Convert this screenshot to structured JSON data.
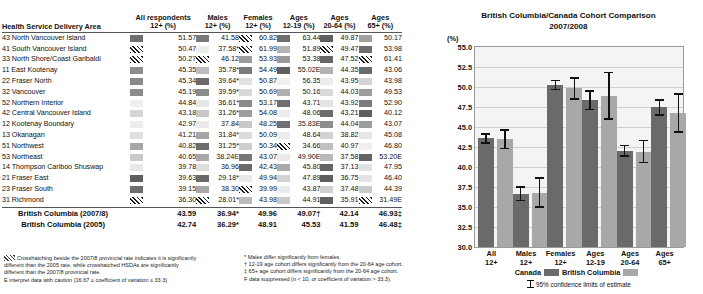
{
  "table": {
    "row_header_label": "Health Service Delivery Area",
    "columns": [
      {
        "title": "All respondents",
        "sub": "12+ (%)"
      },
      {
        "title": "Males",
        "sub": "12+ (%)"
      },
      {
        "title": "Females",
        "sub": "12+ (%)"
      },
      {
        "title": "Ages",
        "sub": "12-19 (%)"
      },
      {
        "title": "Ages",
        "sub": "20-64 (%)"
      },
      {
        "title": "Ages",
        "sub": "65+ (%)"
      }
    ],
    "rows": [
      {
        "name": "43 North Vancouver Island",
        "cells": [
          {
            "v": "51.57",
            "s": "#6f6f6f"
          },
          {
            "v": "41.58",
            "s": "#7a7a7a"
          },
          {
            "v": "60.82",
            "s": "hatch"
          },
          {
            "v": "63.44",
            "s": "#6e6e6e"
          },
          {
            "v": "49.87",
            "s": "#5f5f5f"
          },
          {
            "v": "50.17",
            "s": "#a0a0a0"
          }
        ]
      },
      {
        "name": "41 South Vancouver Island",
        "cells": [
          {
            "v": "50.47",
            "s": "hatch"
          },
          {
            "v": "37.58*",
            "s": "#ededed"
          },
          {
            "v": "61.99",
            "s": "hatch"
          },
          {
            "v": "51.89",
            "s": "#b4b4b4"
          },
          {
            "v": "49.47",
            "s": "hatch"
          },
          {
            "v": "53.98",
            "s": "#6e6e6e"
          }
        ]
      },
      {
        "name": "33 North Shore/Coast Garibaldi",
        "cells": [
          {
            "v": "50.27",
            "s": "hatch"
          },
          {
            "v": "46.12",
            "s": "hatch"
          },
          {
            "v": "53.93",
            "s": "#9c9c9c"
          },
          {
            "v": "53.38",
            "s": "#9a9a9a"
          },
          {
            "v": "47.52",
            "s": "#666666"
          },
          {
            "v": "61.41",
            "s": "hatch"
          }
        ]
      },
      {
        "name": "11 East Kootenay",
        "cells": [
          {
            "v": "45.35",
            "s": "#8d8d8d"
          },
          {
            "v": "35.78*",
            "s": "#bcbcbc"
          },
          {
            "v": "54.49",
            "s": "#7a7a7a"
          },
          {
            "v": "55.02E",
            "s": "#5f5f5f"
          },
          {
            "v": "44.35",
            "s": "#b2b2b2"
          },
          {
            "v": "43.06",
            "s": "#6a6a6a"
          }
        ]
      },
      {
        "name": "22 Fraser North",
        "cells": [
          {
            "v": "45.34",
            "s": "#8a8a8a"
          },
          {
            "v": "39.64*",
            "s": "#6b6b6b"
          },
          {
            "v": "50.87",
            "s": "#e2e2e2"
          },
          {
            "v": "56.35",
            "s": "#efefef"
          },
          {
            "v": "43.95",
            "s": "#ececec"
          },
          {
            "v": "43.98",
            "s": "#d4d4d4"
          }
        ]
      },
      {
        "name": "32 Vancouver",
        "cells": [
          {
            "v": "45.19",
            "s": "#8b8b8b"
          },
          {
            "v": "39.59*",
            "s": "#8c8c8c"
          },
          {
            "v": "50.69",
            "s": "#d8d8d8"
          },
          {
            "v": "50.16",
            "s": "#b0b0b0"
          },
          {
            "v": "44.03",
            "s": "#d9d9d9"
          },
          {
            "v": "49.53",
            "s": "#9d9d9d"
          }
        ]
      },
      {
        "name": "52 Northern Interior",
        "cells": [
          {
            "v": "44.84",
            "s": "#efefef"
          },
          {
            "v": "36.61*",
            "s": "#e6e6e6"
          },
          {
            "v": "53.17",
            "s": "#8a8a8a"
          },
          {
            "v": "43.71",
            "s": "#6f6f6f"
          },
          {
            "v": "43.92",
            "s": "#e4e4e4"
          },
          {
            "v": "52.90",
            "s": "#7b7b7b"
          }
        ]
      },
      {
        "name": "42 Central Vancouver Island",
        "cells": [
          {
            "v": "43.18",
            "s": "#d6d6d6"
          },
          {
            "v": "31.26*",
            "s": "#c7c7c7"
          },
          {
            "v": "54.08",
            "s": "#9e9e9e"
          },
          {
            "v": "48.06",
            "s": "#ececec"
          },
          {
            "v": "43.21",
            "s": "#6d6d6d"
          },
          {
            "v": "40.12",
            "s": "#5e5e5e"
          }
        ]
      },
      {
        "name": "12 Kootenay Boundary",
        "cells": [
          {
            "v": "42.97",
            "s": "#ededed"
          },
          {
            "v": "37.84",
            "s": "#e9e9e9"
          },
          {
            "v": "48.25",
            "s": "#c8c8c8"
          },
          {
            "v": "35.83E",
            "s": "#6f6f6f"
          },
          {
            "v": "44.04",
            "s": "#8e8e8e"
          },
          {
            "v": "43.07",
            "s": "#9c9c9c"
          }
        ]
      },
      {
        "name": "13 Okanagan",
        "cells": [
          {
            "v": "41.21",
            "s": "#e0e0e0"
          },
          {
            "v": "31.84*",
            "s": "#a6a6a6"
          },
          {
            "v": "50.09",
            "s": "#dcdcdc"
          },
          {
            "v": "48.64",
            "s": "#ececec"
          },
          {
            "v": "38.82",
            "s": "#d2d2d2"
          },
          {
            "v": "45.08",
            "s": "#e6e6e6"
          }
        ]
      },
      {
        "name": "51 Northwest",
        "cells": [
          {
            "v": "40.82",
            "s": "#a7a7a7"
          },
          {
            "v": "31.25*",
            "s": "#6c6c6c"
          },
          {
            "v": "50.34",
            "s": "#cecece"
          },
          {
            "v": "34.66",
            "s": "hatch"
          },
          {
            "v": "40.97",
            "s": "#c0c0c0"
          },
          {
            "v": "46.80",
            "s": "#efefef"
          }
        ]
      },
      {
        "name": "53 Northeast",
        "cells": [
          {
            "v": "40.65",
            "s": "#c9c9c9"
          },
          {
            "v": "38.24E",
            "s": "#a9a9a9"
          },
          {
            "v": "43.07",
            "s": "#767676"
          },
          {
            "v": "49.90E",
            "s": "#e9e9e9"
          },
          {
            "v": "37.58",
            "s": "#bababa"
          },
          {
            "v": "53.20E",
            "s": "#636363"
          }
        ]
      },
      {
        "name": "14 Thompson Cariboo Shuswap",
        "cells": [
          {
            "v": "39.78",
            "s": "#e7e7e7"
          },
          {
            "v": "36.96",
            "s": "#dedede"
          },
          {
            "v": "42.43",
            "s": "#6a6a6a"
          },
          {
            "v": "45.80",
            "s": "#a9a9a9"
          },
          {
            "v": "37.13",
            "s": "#646464"
          },
          {
            "v": "47.95",
            "s": "#e1e1e1"
          }
        ]
      },
      {
        "name": "21 Fraser East",
        "cells": [
          {
            "v": "39.63",
            "s": "#5f5f5f"
          },
          {
            "v": "29.18*",
            "s": "#6a6a6a"
          },
          {
            "v": "49.94",
            "s": "#e8e8e8"
          },
          {
            "v": "47.89",
            "s": "#d3d3d3"
          },
          {
            "v": "36.75",
            "s": "#5d5d5d"
          },
          {
            "v": "46.40",
            "s": "#e3e3e3"
          }
        ]
      },
      {
        "name": "23 Fraser South",
        "cells": [
          {
            "v": "39.15",
            "s": "#6d6d6d"
          },
          {
            "v": "38.30",
            "s": "#a7a7a7"
          },
          {
            "v": "39.99",
            "s": "hatch"
          },
          {
            "v": "43.87",
            "s": "#ebebeb"
          },
          {
            "v": "37.48",
            "s": "#d0d0d0"
          },
          {
            "v": "44.39",
            "s": "#cacaca"
          }
        ]
      },
      {
        "name": "31 Richmond",
        "cells": [
          {
            "v": "36.30",
            "s": "hatch"
          },
          {
            "v": "28.01*",
            "s": "hatch"
          },
          {
            "v": "43.98",
            "s": "#bcbcbc"
          },
          {
            "v": "44.91",
            "s": "#c9c9c9"
          },
          {
            "v": "35.91",
            "s": "#606060"
          },
          {
            "v": "31.49E",
            "s": "hatch"
          }
        ]
      }
    ],
    "summary": [
      {
        "name": "British Columbia (2007/8)",
        "values": [
          "43.59",
          "36.94*",
          "49.96",
          "49.07†",
          "42.14",
          "46.93‡"
        ]
      },
      {
        "name": "British Columbia (2005)",
        "values": [
          "42.74",
          "36.29*",
          "48.91",
          "45.53",
          "41.59",
          "46.48‡"
        ]
      }
    ]
  },
  "footnotes": {
    "left": [
      "Crosshatching beside the 2007/8 provincial rate indicates it is significantly different than the 2005 rate, while crosshatched HSDAs are significantly different than the 2007/8 provincial rate.",
      "E interpret data with caution (16.67 ≤ coefficient of variation ≤ 33.3)"
    ],
    "right": [
      "* Males differ significantly from females.",
      "† 12-19 age cohort differs significantly from the 20-64 age cohort.",
      "‡ 65+ age cohort differs significantly from the 20-64 age cohort.",
      "F data suppressed (n < 10, or coefficient of variation > 33.3)."
    ]
  },
  "chart_data": {
    "type": "bar",
    "title": "British Columbia/Canada Cohort Comparison",
    "subtitle": "2007/2008",
    "ylabel": "(%)",
    "xlabel": "",
    "ylim": [
      30.0,
      55.0
    ],
    "yticks": [
      "55.0",
      "52.5",
      "50.0",
      "47.5",
      "45.0",
      "42.5",
      "40.0",
      "37.5",
      "35.0",
      "32.5",
      "30.0"
    ],
    "grid": true,
    "legend_position": "bottom",
    "categories": [
      "All\n12+",
      "Males\n12+",
      "Females\n12+",
      "Ages\n12-19",
      "Ages\n20-64",
      "Ages\n65+"
    ],
    "category_lines": [
      [
        "All",
        "12+"
      ],
      [
        "Males",
        "12+"
      ],
      [
        "Females",
        "12+"
      ],
      [
        "Ages",
        "12-19"
      ],
      [
        "Ages",
        "20-64"
      ],
      [
        "Ages",
        "65+"
      ]
    ],
    "series": [
      {
        "name": "Canada",
        "color": "#6a6a6a",
        "values": [
          43.6,
          36.6,
          50.3,
          48.4,
          42.0,
          47.5
        ],
        "ci_low": [
          42.9,
          35.7,
          49.6,
          47.1,
          41.3,
          46.4
        ],
        "ci_high": [
          44.2,
          37.6,
          50.9,
          49.6,
          42.8,
          48.5
        ]
      },
      {
        "name": "British Columbia",
        "color": "#a8a8a8",
        "values": [
          43.5,
          36.8,
          49.9,
          48.9,
          41.9,
          46.7
        ],
        "ci_low": [
          42.2,
          34.9,
          48.4,
          45.9,
          40.5,
          44.3
        ],
        "ci_high": [
          44.7,
          38.7,
          51.2,
          51.9,
          43.4,
          49.2
        ]
      }
    ],
    "legend_note": "95% confidence limits of estimate",
    "legend_entries": [
      "Canada",
      "British Columbia"
    ]
  }
}
